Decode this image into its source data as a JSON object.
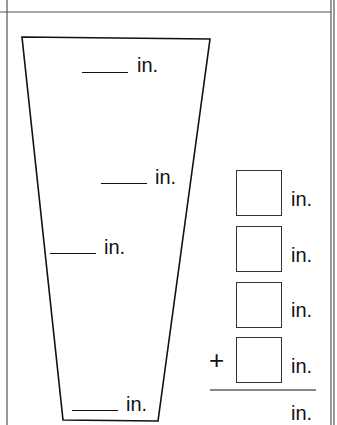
{
  "figure": {
    "shape": "trapezoid",
    "unit_label": "in.",
    "side_labels": [
      {
        "position": "top",
        "unit": "in."
      },
      {
        "position": "right-middle",
        "unit": "in."
      },
      {
        "position": "left-middle",
        "unit": "in."
      },
      {
        "position": "bottom",
        "unit": "in."
      }
    ]
  },
  "addition": {
    "addends": [
      {
        "unit": "in."
      },
      {
        "unit": "in."
      },
      {
        "unit": "in."
      },
      {
        "unit": "in.",
        "operator": "+"
      }
    ],
    "operator": "+",
    "total_unit": "in."
  },
  "colors": {
    "line": "#111111",
    "border": "#555555",
    "background": "#ffffff"
  }
}
